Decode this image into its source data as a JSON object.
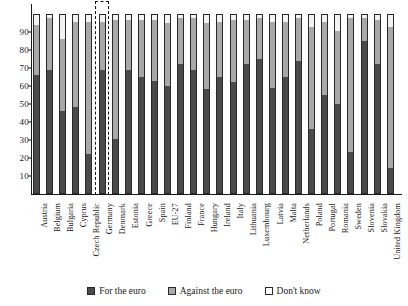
{
  "chart_data": {
    "type": "bar",
    "subtype": "stacked-vertical-percent",
    "title": "",
    "xlabel": "",
    "ylabel": "",
    "ylim": [
      0,
      100
    ],
    "yticks": [
      10,
      20,
      30,
      40,
      50,
      60,
      70,
      80,
      90
    ],
    "grid": false,
    "legend_position": "bottom-center",
    "highlight": {
      "category": "Germany",
      "style": "dashed-box"
    },
    "categories": [
      "Austria",
      "Belgium",
      "Bulgaria",
      "Cyprus",
      "Czech Republic",
      "Germany",
      "Denmark",
      "Estonia",
      "Greece",
      "Spain",
      "EU-27",
      "Finland",
      "France",
      "Hungary",
      "Ireland",
      "Italy",
      "Lithuania",
      "Luxembourg",
      "Latvia",
      "Malta",
      "Netherlands",
      "Poland",
      "Portugal",
      "Romania",
      "Sweden",
      "Slovenia",
      "Slovakia",
      "United Kingdom"
    ],
    "series": [
      {
        "name": "For the euro",
        "color": "#4a4a4a",
        "values": [
          66,
          69,
          46,
          48,
          22,
          69,
          30,
          69,
          65,
          63,
          60,
          72,
          69,
          58,
          65,
          62,
          72,
          75,
          59,
          65,
          74,
          36,
          55,
          50,
          23,
          85,
          72,
          14
        ]
      },
      {
        "name": "Against the euro",
        "color": "#a8a8a8",
        "values": [
          28,
          29,
          40,
          48,
          74,
          27,
          67,
          28,
          32,
          34,
          35,
          26,
          29,
          37,
          31,
          35,
          25,
          23,
          37,
          31,
          24,
          57,
          41,
          41,
          75,
          13,
          25,
          79
        ]
      },
      {
        "name": "Don't know",
        "color": "#f2f2f2",
        "values": [
          6,
          2,
          14,
          4,
          4,
          4,
          3,
          3,
          3,
          3,
          5,
          2,
          2,
          5,
          4,
          3,
          3,
          2,
          4,
          4,
          2,
          7,
          4,
          9,
          2,
          2,
          3,
          7
        ]
      }
    ]
  },
  "legend": {
    "items": [
      {
        "label": "For the euro",
        "swatch": "sw-for"
      },
      {
        "label": "Against the euro",
        "swatch": "sw-against"
      },
      {
        "label": "Don't know",
        "swatch": "sw-dk"
      }
    ]
  }
}
